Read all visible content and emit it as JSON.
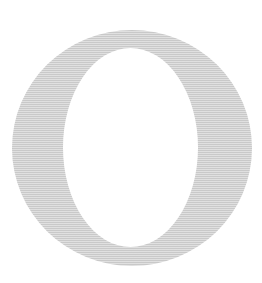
{
  "canvas": {
    "width": 262,
    "height": 283,
    "background_color": "#ffffff"
  },
  "glyph": {
    "character": "O",
    "name": "letter-o",
    "description": "Capital letter O",
    "typeface_style": "high-contrast serif (Didone)",
    "fill_color": "#c9c9c9",
    "outer_ellipse": {
      "center_x": 132,
      "center_y": 148,
      "radius_x": 120,
      "radius_y": 118
    },
    "inner_counter": {
      "center_x": 130.5,
      "center_y": 147.5,
      "radius_x": 67.5,
      "radius_y": 99.5,
      "fill_color": "#ffffff"
    },
    "stroke_weights": {
      "left_side_px": 51,
      "right_side_px": 54,
      "top_px": 18,
      "bottom_px": 19
    }
  },
  "texture": {
    "name": "horizontal-scanlines",
    "line_color": "#ffffff",
    "opacity": 0.42,
    "period_px": 2
  }
}
